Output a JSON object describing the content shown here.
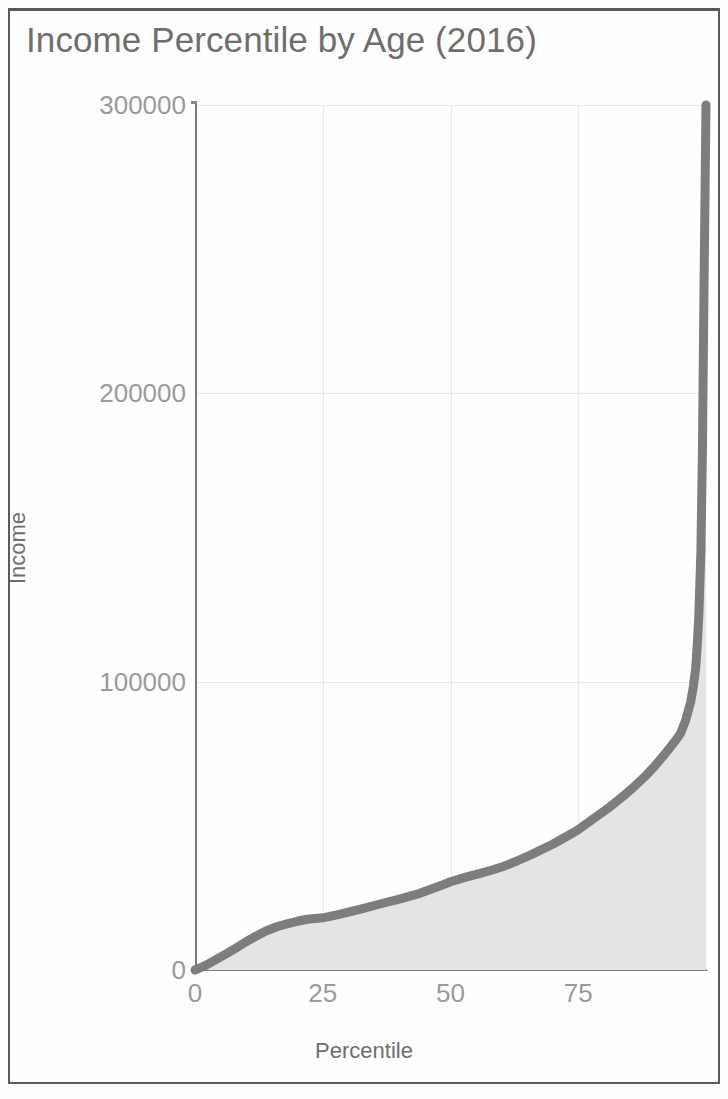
{
  "document": {
    "frame_color": "#5a5a5a",
    "background": "#fdfdfd"
  },
  "chart_data": {
    "type": "area",
    "title": "Income Percentile by Age (2016)",
    "xlabel": "Percentile",
    "ylabel": "Income",
    "xlim": [
      0,
      100
    ],
    "ylim": [
      0,
      300000
    ],
    "xticks": [
      0,
      25,
      50,
      75
    ],
    "xtick_labels": [
      "0",
      "25",
      "50",
      "75"
    ],
    "yticks": [
      0,
      100000,
      200000,
      300000
    ],
    "ytick_labels": [
      "0",
      "100000",
      "200000",
      "300000"
    ],
    "grid": true,
    "legend": null,
    "line_color": "#7d7d7d",
    "fill_color": "#e4e4e4",
    "series": [
      {
        "name": "Income",
        "x": [
          0,
          2,
          4,
          6,
          8,
          10,
          12,
          14,
          16,
          18,
          20,
          22,
          25,
          28,
          30,
          33,
          36,
          40,
          44,
          48,
          50,
          53,
          56,
          58,
          60,
          63,
          66,
          70,
          74,
          75,
          78,
          81,
          84,
          86,
          88,
          90,
          92,
          94,
          95,
          96,
          97,
          97.5,
          98,
          98.3,
          98.6,
          99,
          99.3,
          99.6,
          100
        ],
        "y": [
          0,
          1500,
          3500,
          5500,
          7600,
          9800,
          11800,
          13600,
          15000,
          16000,
          16900,
          17600,
          18100,
          19200,
          20100,
          21400,
          22800,
          24600,
          26600,
          29200,
          30600,
          32200,
          33600,
          34600,
          35700,
          37800,
          40200,
          43600,
          47600,
          48700,
          52500,
          56300,
          60600,
          63700,
          67000,
          70800,
          75000,
          79500,
          82000,
          86500,
          93000,
          98000,
          105000,
          113000,
          123000,
          145000,
          180000,
          235000,
          300000
        ]
      }
    ]
  }
}
